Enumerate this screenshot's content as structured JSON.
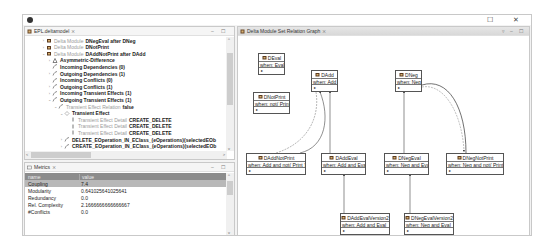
{
  "window": {
    "maximize_glyph": "☐",
    "close_glyph": "✕"
  },
  "tree_view": {
    "tab_title": "EPL.deltamodel",
    "tab_close": "⨯",
    "min_glyph": "–",
    "max_glyph": "☐",
    "rows": [
      {
        "indent": 0,
        "twisty": "›",
        "icon": "delta-module-icon",
        "prefix": "Delta Module",
        "label": "DNegEval after DNeg"
      },
      {
        "indent": 0,
        "twisty": "›",
        "icon": "delta-module-icon",
        "prefix": "Delta Module",
        "label": "DNotPrint"
      },
      {
        "indent": 0,
        "twisty": "⌄",
        "icon": "delta-module-icon",
        "prefix": "Delta Module",
        "label": "DAddNotPrint after DAdd"
      },
      {
        "indent": 1,
        "twisty": "›",
        "icon": "asymmetric-difference-icon",
        "prefix": "",
        "label": "Asymmetric-Difference"
      },
      {
        "indent": 1,
        "twisty": "",
        "icon": "incoming-dependencies-icon",
        "prefix": "",
        "label": "Incoming Dependencies (0)"
      },
      {
        "indent": 1,
        "twisty": "›",
        "icon": "outgoing-dependencies-icon",
        "prefix": "",
        "label": "Outgoing Dependencies (1)"
      },
      {
        "indent": 1,
        "twisty": "",
        "icon": "incoming-conflicts-icon",
        "prefix": "",
        "label": "Incoming Conflicts (0)"
      },
      {
        "indent": 1,
        "twisty": "›",
        "icon": "outgoing-conflicts-icon",
        "prefix": "",
        "label": "Outgoing Conflicts (1)"
      },
      {
        "indent": 1,
        "twisty": "›",
        "icon": "incoming-transient-effects-icon",
        "prefix": "",
        "label": "Incoming Transient Effects (1)"
      },
      {
        "indent": 1,
        "twisty": "⌄",
        "icon": "outgoing-transient-effects-icon",
        "prefix": "",
        "label": "Outgoing Transient Effects (1)"
      },
      {
        "indent": 2,
        "twisty": "⌄",
        "icon": "transient-effect-relation-icon",
        "prefix": "Transient Effect Relation",
        "label": "false"
      },
      {
        "indent": 3,
        "twisty": "⌄",
        "icon": "transient-effect-icon",
        "prefix": "",
        "label": "Transient Effect"
      },
      {
        "indent": 4,
        "twisty": "",
        "icon": "transient-effect-detail-icon",
        "prefix": "Transient Effect Detail",
        "label": "CREATE_DELETE"
      },
      {
        "indent": 4,
        "twisty": "",
        "icon": "transient-effect-detail-icon",
        "prefix": "Transient Effect Detail",
        "label": "CREATE_DELETE"
      },
      {
        "indent": 4,
        "twisty": "",
        "icon": "transient-effect-detail-icon",
        "prefix": "Transient Effect Detail",
        "label": "CREATE_DELETE"
      },
      {
        "indent": 3,
        "twisty": "›",
        "icon": "operation-icon",
        "prefix": "",
        "label": "DELETE_EOperation_IN_EClass_(eOperations)(selectedEOb"
      },
      {
        "indent": 3,
        "twisty": "›",
        "icon": "operation-icon",
        "prefix": "",
        "label": "CREATE_EOperation_IN_EClass_(eOperations)(selectedEOb"
      }
    ]
  },
  "metrics_view": {
    "tab_title": "Metrics",
    "tab_close": "⨯",
    "min_glyph": "–",
    "max_glyph": "☐",
    "columns": [
      "name",
      "value"
    ],
    "rows": [
      {
        "name": "Coupling",
        "value": "7.4",
        "selected": true
      },
      {
        "name": "Modularity",
        "value": "0.641025641025641",
        "selected": false
      },
      {
        "name": "Redundancy",
        "value": "0.0",
        "selected": false
      },
      {
        "name": "Rel. Complexity",
        "value": "2.1666666666666667",
        "selected": false
      },
      {
        "name": "#Conflicts",
        "value": "0.0",
        "selected": false
      }
    ]
  },
  "graph_view": {
    "tab_title": "Delta Module Set Relation Graph",
    "tab_close": "⨯",
    "menu_glyph": "▿",
    "min_glyph": "–",
    "max_glyph": "☐",
    "nodes": [
      {
        "id": "DEval",
        "title": "DEval",
        "when": "when: Eval",
        "x": 20,
        "y": 16,
        "w": 27
      },
      {
        "id": "DNotPrint",
        "title": "DNotPrint",
        "when": "when: not( Print )",
        "x": 15,
        "y": 55,
        "w": 37
      },
      {
        "id": "DAdd",
        "title": "DAdd",
        "when": "when: Add",
        "x": 73,
        "y": 33,
        "w": 27
      },
      {
        "id": "DNeg",
        "title": "DNeg",
        "when": "when: Neg",
        "x": 157,
        "y": 33,
        "w": 27
      },
      {
        "id": "DAddNotPrint",
        "title": "DAddNotPrint",
        "when": "when: Add and not( Print )",
        "x": 8,
        "y": 116,
        "w": 60
      },
      {
        "id": "DAddEval",
        "title": "DAddEval",
        "when": "when: Add and Eval",
        "x": 83,
        "y": 116,
        "w": 45
      },
      {
        "id": "DNegEval",
        "title": "DNegEval",
        "when": "when: Neg and Eval",
        "x": 146,
        "y": 116,
        "w": 45
      },
      {
        "id": "DNegNotPrint",
        "title": "DNegNotPrint",
        "when": "when: Neg and not( Print )",
        "x": 208,
        "y": 116,
        "w": 58
      },
      {
        "id": "DAddEvalVersion2",
        "title": "DAddEvalVersion2",
        "when": "when: Add and Eval",
        "x": 102,
        "y": 176,
        "w": 50
      },
      {
        "id": "DNegEvalVersion2",
        "title": "DNegEvalVersion2",
        "when": "when: Neg and Eval",
        "x": 166,
        "y": 176,
        "w": 50
      }
    ],
    "node_attr_glyph": "▸"
  }
}
